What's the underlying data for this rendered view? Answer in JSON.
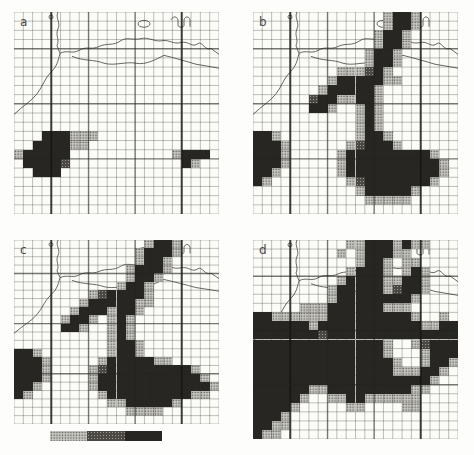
{
  "figure": {
    "type": "four-panel gridded map figure",
    "panel_labels": [
      "a",
      "b",
      "c",
      "d"
    ]
  },
  "colors": {
    "page_bg": "#fdfdfb",
    "panel_bg": "#fbfbf8",
    "cell_light": "#c9c9c4",
    "cell_medium": "#4c4944",
    "cell_dark": "#272623",
    "grid_line": "#5a5a55",
    "coastline": "#56544e"
  },
  "grid": {
    "cols": 22,
    "rows": 22,
    "v_medium": [
      8,
      13
    ],
    "v_thick": [
      4,
      18
    ],
    "h_medium": [
      4,
      10,
      16
    ],
    "h_thick": []
  },
  "map": {
    "coast_paths": [
      "M44,0 C41,6 47,11 44,17 C41,24 46,28 43,34 L46,42",
      "M0,104 C9,95 17,91 23,83 C29,75 31,67 37,61 C43,55 44,50 46,42",
      "M46,42 C53,38 58,43 65,39 C73,34 77,39 85,35 C93,31 99,35 107,29 C113,25 119,29 127,27 C135,25 141,31 149,29 C155,28 159,33 167,31 C175,29 178,37 184,32 C188,29 191,40 197,37 L205,43",
      "M58,45 C70,50 80,48 90,52 C100,55 112,50 122,52 C132,54 142,48 150,44",
      "M150,44 C162,47 172,50 182,53 L205,57",
      "M157,8 C159,4 163,4 164,8 L164,14 C166,16 169,16 170,14 L170,8 C171,4 175,4 176,8 L176,15"
    ],
    "islands": [
      {
        "type": "ellipse",
        "cx": 130,
        "cy": 12,
        "rx": 6,
        "ry": 3.5
      },
      {
        "type": "circle",
        "cx": 37,
        "cy": 5,
        "r": 2
      }
    ]
  },
  "legend": {
    "levels": [
      {
        "name": "low",
        "style": "light-stipple"
      },
      {
        "name": "medium",
        "style": "dark-stipple"
      },
      {
        "name": "high",
        "style": "solid-dark"
      }
    ]
  },
  "panels": [
    {
      "label": "a",
      "cells": [
        "......................",
        "......................",
        "......................",
        "......................",
        "......................",
        "......................",
        "......................",
        "......................",
        "......................",
        "......................",
        "......................",
        "......................",
        "......................",
        "...333111.............",
        "..333311..............",
        "133333...........1333.",
        ".33332............31..",
        "..333.................",
        "......................",
        "......................",
        "......................",
        "......................"
      ]
    },
    {
      "label": "b",
      "cells": [
        "..............1331....",
        "..............1331....",
        ".............1331.....",
        ".............1331.....",
        "............1331......",
        "............1331......",
        ".........111231.......",
        "........13333311......",
        ".......1333331........",
        "......23311331........",
        "......331..131........",
        "...........131........",
        "...........131........",
        "331........1331.......",
        "3331......123331......",
        "3331.....13333333331..",
        "3331.....133333333331.",
        "331......133333333331.",
        "31........1233333331..",
        "...........1333331....",
        "............11111.....",
        "......................"
      ]
    },
    {
      "label": "c",
      "cells": [
        "..............1331....",
        ".............13331....",
        ".............1331.....",
        "............13331.....",
        "............1331......",
        "...........1331.......",
        "........1233331.......",
        ".......13333311.......",
        "......13331331........",
        ".....1331.131.........",
        ".....331..131.........",
        "..........131.........",
        "..........1331........",
        "331.......1331........",
        "3331.....13333311.....",
        "3331....123333333331..",
        "3331....1333333333331.",
        "331.....13333333333331",
        "31.......133333333311.",
        "..........11333331....",
        "............1111......",
        "......................"
      ]
    },
    {
      "label": "d",
      "cells": [
        "..........113331311...",
        ".........1.133311.....",
        "...........1331.11....",
        "..........13331.131...",
        ".........1333311331...",
        "........13333312331...",
        "........1333333331....",
        ".....111333333111.....",
        "331111113333333331..1.",
        "3333331333333333331133",
        "3333333233333333333333",
        "333333333333331..12333",
        "333333333333331...1333",
        "3333333333333331..1331",
        "333333333333333111331.",
        "33333333333333333331..",
        "3333331133333333311...",
        "333331..1133111111....",
        "33331.....11....11....",
        "3331..................",
        "3311..................",
        "311..................."
      ]
    }
  ]
}
